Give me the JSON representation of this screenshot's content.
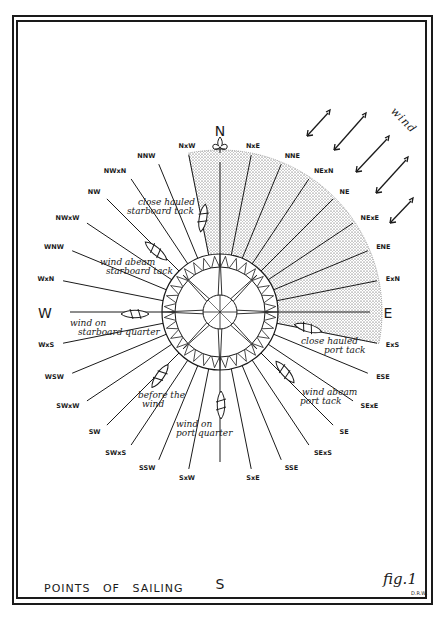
{
  "figure": {
    "title": "POINTS OF SAILING",
    "fig_label": "fig.1",
    "initials": "D.R.W."
  },
  "compass": {
    "center": [
      220,
      312
    ],
    "ray_length": 160,
    "cardinals": {
      "N": "N",
      "E": "E",
      "S": "S",
      "W": "W"
    },
    "points": [
      {
        "name": "NxW",
        "bearing": 348.75
      },
      {
        "name": "NxE",
        "bearing": 11.25
      },
      {
        "name": "NNE",
        "bearing": 22.5
      },
      {
        "name": "NExN",
        "bearing": 33.75
      },
      {
        "name": "NE",
        "bearing": 45
      },
      {
        "name": "NExE",
        "bearing": 56.25
      },
      {
        "name": "ENE",
        "bearing": 67.5
      },
      {
        "name": "ExN",
        "bearing": 78.75
      },
      {
        "name": "ExS",
        "bearing": 101.25
      },
      {
        "name": "ESE",
        "bearing": 112.5
      },
      {
        "name": "SExE",
        "bearing": 123.75
      },
      {
        "name": "SE",
        "bearing": 135
      },
      {
        "name": "SExS",
        "bearing": 146.25
      },
      {
        "name": "SSE",
        "bearing": 157.5
      },
      {
        "name": "SxE",
        "bearing": 168.75
      },
      {
        "name": "SxW",
        "bearing": 191.25
      },
      {
        "name": "SSW",
        "bearing": 202.5
      },
      {
        "name": "SWxS",
        "bearing": 213.75
      },
      {
        "name": "SW",
        "bearing": 225
      },
      {
        "name": "SWxW",
        "bearing": 236.25
      },
      {
        "name": "WSW",
        "bearing": 247.5
      },
      {
        "name": "WxS",
        "bearing": 258.75
      },
      {
        "name": "WxN",
        "bearing": 281.25
      },
      {
        "name": "WNW",
        "bearing": 292.5
      },
      {
        "name": "NW",
        "bearing": 315
      },
      {
        "name": "NWxW",
        "bearing": 303.75
      },
      {
        "name": "NWxN",
        "bearing": 326.25
      },
      {
        "name": "NNW",
        "bearing": 337.5
      }
    ],
    "no_go_zone": {
      "from": "NxW",
      "to": "ExS",
      "pattern": "stippled"
    }
  },
  "wind": {
    "label": "wind",
    "arrow_count": 5,
    "direction": "from NE"
  },
  "annotations": [
    {
      "id": "close-hauled-starboard",
      "lines": [
        "close hauled",
        "starboard tack"
      ]
    },
    {
      "id": "wind-abeam-starboard",
      "lines": [
        "wind abeam",
        "starboard tack"
      ]
    },
    {
      "id": "wind-starboard-quarter",
      "lines": [
        "wind on",
        "starboard quarter"
      ]
    },
    {
      "id": "before-the-wind",
      "lines": [
        "before the",
        "wind"
      ]
    },
    {
      "id": "wind-port-quarter",
      "lines": [
        "wind on",
        "port quarter"
      ]
    },
    {
      "id": "wind-abeam-port",
      "lines": [
        "wind abeam",
        "port tack"
      ]
    },
    {
      "id": "close-hauled-port",
      "lines": [
        "close hauled",
        "port tack"
      ]
    }
  ]
}
